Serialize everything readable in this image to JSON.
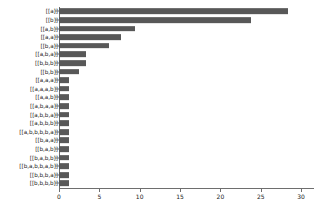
{
  "chart_data": {
    "type": "bar",
    "orientation": "horizontal",
    "title": "",
    "xlabel": "",
    "ylabel": "",
    "xlim": [
      0,
      31.6
    ],
    "xticks": [
      0,
      5,
      10,
      15,
      20,
      25,
      30
    ],
    "grid": false,
    "legend": null,
    "bar_color": "#585858",
    "axis_color": "#6e6e6e",
    "categories": [
      "[[a]]",
      "[[b]]",
      "[[a,b]]",
      "[[a,a]]",
      "[[b,a]]",
      "[[a,b,a]]",
      "[[b,b,b]]",
      "[[b,b]]",
      "[[a,a,a]]",
      "[[a,a,a,b]]",
      "[[a,a,b]]",
      "[[a,b,a,a]]",
      "[[a,b,b,a]]",
      "[[a,b,b,b]]",
      "[[a,b,b,b,b,a]]",
      "[[b,a,a]]",
      "[[b,a,b]]",
      "[[b,a,b,b]]",
      "[[b,a,b,b,a,b]]",
      "[[b,b,b,a]]",
      "[[b,b,b,b]]"
    ],
    "values": [
      28.4,
      23.8,
      9.4,
      7.7,
      6.2,
      3.4,
      3.4,
      2.5,
      1.3,
      1.3,
      1.3,
      1.3,
      1.3,
      1.3,
      1.3,
      1.3,
      1.3,
      1.3,
      1.3,
      1.3,
      1.3
    ]
  }
}
